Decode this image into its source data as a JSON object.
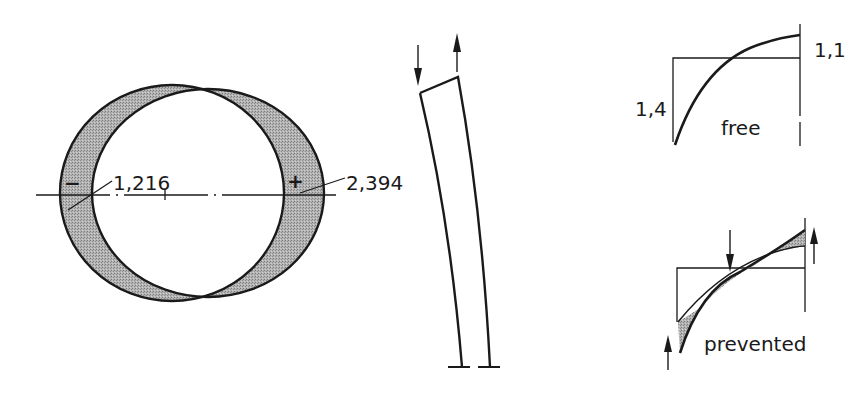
{
  "cross_section": {
    "left_sign": "−",
    "left_value": "1,216",
    "right_sign": "+",
    "right_value": "2,394"
  },
  "beam": {
    "arrow_left": "down-arrow",
    "arrow_right": "up-arrow"
  },
  "free_plot": {
    "left_value": "1,4",
    "right_value": "1,1",
    "label": "free"
  },
  "prevented_plot": {
    "label": "prevented"
  },
  "colors": {
    "stroke": "#1a1a1a",
    "shade": "#a8a8a8",
    "background": "#ffffff"
  }
}
